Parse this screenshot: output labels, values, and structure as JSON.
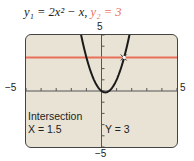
{
  "chart_data": {
    "type": "line",
    "title": "",
    "series": [
      {
        "name": "y1",
        "equation": "y1 = 2x^2 - x",
        "color": "#1a1a1a",
        "x": [
          -1.75,
          -1.5,
          -1,
          -0.5,
          0,
          0.25,
          0.5,
          1,
          1.5,
          2
        ],
        "y": [
          7.875,
          6,
          3,
          1,
          0,
          -0.125,
          0,
          1,
          3,
          6
        ]
      },
      {
        "name": "y2",
        "equation": "y2 = 3",
        "color": "#e8705a",
        "x": [
          -5,
          5
        ],
        "y": [
          3,
          3
        ]
      }
    ],
    "xlim": [
      -5,
      5
    ],
    "ylim": [
      -5,
      5
    ],
    "xticks": [
      -5,
      -4,
      -3,
      -2,
      -1,
      0,
      1,
      2,
      3,
      4,
      5
    ],
    "yticks": [
      -5,
      -4,
      -3,
      -2,
      -1,
      0,
      1,
      2,
      3,
      4,
      5
    ],
    "annotations": [
      {
        "text": "Intersection",
        "x": 1.5,
        "y": 3
      }
    ],
    "grid": false
  },
  "header": {
    "eq1": "y₁ = 2x² − x,",
    "eq2": "y₂ = 3"
  },
  "axis_labels": {
    "top": "5",
    "bottom": "−5",
    "left": "−5",
    "right": "5"
  },
  "readout": {
    "title": "Intersection",
    "x": "X = 1.5",
    "y": "Y = 3"
  }
}
